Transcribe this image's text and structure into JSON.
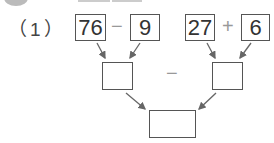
{
  "problem": {
    "label": "（1）",
    "top_row": {
      "left_expr": {
        "a": "76",
        "op": "−",
        "b": "9"
      },
      "right_expr": {
        "a": "27",
        "op": "+",
        "b": "6"
      }
    },
    "middle_row": {
      "left_value": "",
      "op": "−",
      "right_value": ""
    },
    "result": {
      "value": ""
    }
  },
  "colors": {
    "box_border": "#555555",
    "arrow": "#666666",
    "operator": "#999999"
  }
}
